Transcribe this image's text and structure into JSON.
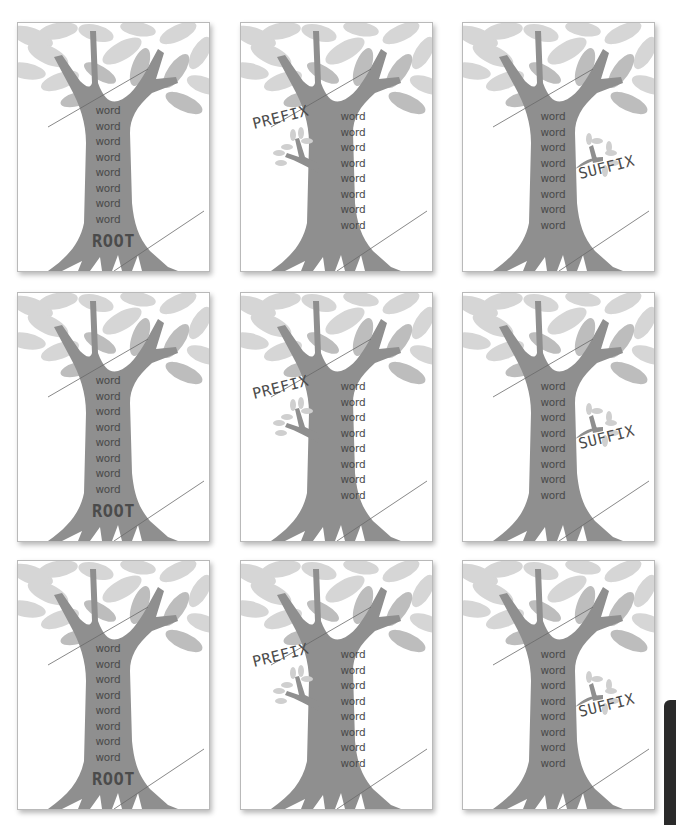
{
  "worksheet": {
    "colors": {
      "trunk": "#8f8f8f",
      "leaf_light": "#d9d9d9",
      "leaf_mid": "#bdbdbd",
      "text": "#4a4a4a",
      "card_border": "#b9b9b9",
      "side_tab": "#2a2a2a"
    },
    "rows": [
      {
        "cards": [
          {
            "type": "root",
            "label": "ROOT",
            "words": [
              "word",
              "word",
              "word",
              "word",
              "word",
              "word",
              "word",
              "word"
            ]
          },
          {
            "type": "prefix",
            "label": "PREFIX",
            "words": [
              "word",
              "word",
              "word",
              "word",
              "word",
              "word",
              "word",
              "word"
            ]
          },
          {
            "type": "suffix",
            "label": "SUFFIX",
            "words": [
              "word",
              "word",
              "word",
              "word",
              "word",
              "word",
              "word",
              "word"
            ]
          }
        ]
      },
      {
        "cards": [
          {
            "type": "root",
            "label": "ROOT",
            "words": [
              "word",
              "word",
              "word",
              "word",
              "word",
              "word",
              "word",
              "word"
            ]
          },
          {
            "type": "prefix",
            "label": "PREFIX",
            "words": [
              "word",
              "word",
              "word",
              "word",
              "word",
              "word",
              "word",
              "word"
            ]
          },
          {
            "type": "suffix",
            "label": "SUFFIX",
            "words": [
              "word",
              "word",
              "word",
              "word",
              "word",
              "word",
              "word",
              "word"
            ]
          }
        ]
      },
      {
        "cards": [
          {
            "type": "root",
            "label": "ROOT",
            "words": [
              "word",
              "word",
              "word",
              "word",
              "word",
              "word",
              "word",
              "word"
            ]
          },
          {
            "type": "prefix",
            "label": "PREFIX",
            "words": [
              "word",
              "word",
              "word",
              "word",
              "word",
              "word",
              "word",
              "word"
            ]
          },
          {
            "type": "suffix",
            "label": "SUFFIX",
            "words": [
              "word",
              "word",
              "word",
              "word",
              "word",
              "word",
              "word",
              "word"
            ]
          }
        ]
      }
    ]
  }
}
